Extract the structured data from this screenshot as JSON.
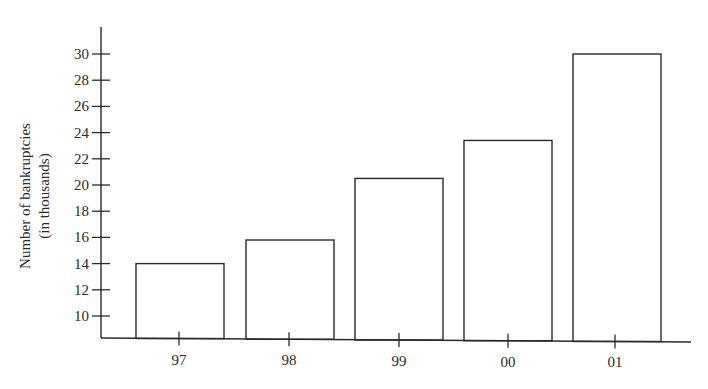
{
  "chart_data": {
    "type": "bar",
    "title": "",
    "xlabel": "",
    "ylabel": "Number of bankruptcies (in thousands)",
    "ylabel_lines": [
      "Number of bankruptcies",
      "(in thousands)"
    ],
    "categories": [
      "97",
      "98",
      "99",
      "00",
      "01"
    ],
    "values": [
      14.0,
      15.8,
      20.5,
      23.4,
      30.0
    ],
    "yticks": [
      10,
      12,
      14,
      16,
      18,
      20,
      22,
      24,
      26,
      28,
      30
    ],
    "ylim": [
      8.2,
      32
    ],
    "y_axis_broken": true,
    "grid": false,
    "legend": null,
    "bar_fill": "#ffffff",
    "bar_stroke": "#2a2a2a"
  }
}
